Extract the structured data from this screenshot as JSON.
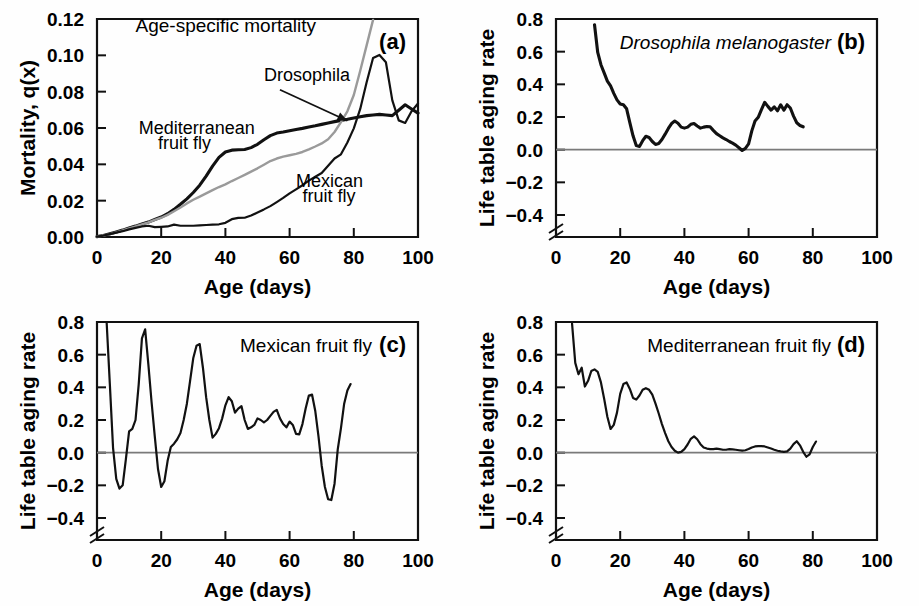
{
  "figure": {
    "caption_letters": [
      "(a)",
      "(b)",
      "(c)",
      "(d)"
    ],
    "shared_xlabel": "Age (days)",
    "colors": {
      "dark": "#111111",
      "grey": "#9a9a9a",
      "zeroline": "#7a7a7a",
      "background": "#ffffff"
    }
  },
  "chart_data": [
    {
      "id": "panel-a",
      "letter": "(a)",
      "type": "line",
      "title": "Age-specific mortality",
      "xlabel": "Age (days)",
      "ylabel": "Mortality, q(x)",
      "xlim": [
        0,
        100
      ],
      "ylim": [
        0,
        0.12
      ],
      "xticks": [
        0,
        20,
        40,
        60,
        80,
        100
      ],
      "xtick_labels": [
        "0",
        "20",
        "40",
        "60",
        "80",
        "100"
      ],
      "yticks": [
        0.0,
        0.02,
        0.04,
        0.06,
        0.08,
        0.1,
        0.12
      ],
      "ytick_labels": [
        "0.00",
        "0.02",
        "0.04",
        "0.06",
        "0.08",
        "0.10",
        "0.12"
      ],
      "grid": false,
      "axis_break": false,
      "legend": "inline-annotations",
      "annotations": [
        {
          "text": "Age-specific mortality",
          "x": 12,
          "y": 0.113,
          "style": "title"
        },
        {
          "text": "Drosophila",
          "x": 52,
          "y": 0.086,
          "style": "series",
          "leader_to": [
            78,
            0.064
          ]
        },
        {
          "text": "Mediterranean",
          "x": 13,
          "y": 0.0565,
          "style": "series"
        },
        {
          "text": "fruit fly",
          "x": 19,
          "y": 0.0485,
          "style": "series"
        },
        {
          "text": "Mexican",
          "x": 62,
          "y": 0.0275,
          "style": "series"
        },
        {
          "text": "fruit fly",
          "x": 64,
          "y": 0.0195,
          "style": "series"
        }
      ],
      "series": [
        {
          "name": "Mediterranean fruit fly",
          "color": "#111111",
          "width": "thick",
          "x": [
            0,
            2,
            4,
            6,
            8,
            10,
            12,
            14,
            16,
            18,
            20,
            22,
            24,
            26,
            28,
            30,
            32,
            34,
            36,
            38,
            40,
            42,
            44,
            46,
            48,
            50,
            52,
            54,
            56,
            58,
            60,
            62,
            64,
            66,
            68,
            70,
            72,
            74,
            76,
            78,
            80,
            82,
            84,
            86,
            88,
            90,
            92,
            94,
            96,
            98,
            100
          ],
          "values": [
            0.0002,
            0.0008,
            0.0018,
            0.0028,
            0.0038,
            0.005,
            0.006,
            0.0072,
            0.0082,
            0.0096,
            0.011,
            0.0128,
            0.0152,
            0.018,
            0.021,
            0.0245,
            0.0285,
            0.0335,
            0.039,
            0.0438,
            0.0468,
            0.0478,
            0.048,
            0.0482,
            0.0492,
            0.051,
            0.0535,
            0.0558,
            0.0572,
            0.0578,
            0.0585,
            0.0592,
            0.0598,
            0.0605,
            0.0612,
            0.062,
            0.0628,
            0.0635,
            0.0642,
            0.0648,
            0.0655,
            0.0662,
            0.0668,
            0.0672,
            0.0675,
            0.0672,
            0.0668,
            0.0698,
            0.0728,
            0.0705,
            0.0682
          ]
        },
        {
          "name": "Drosophila",
          "color": "#9a9a9a",
          "width": "grey",
          "x": [
            0,
            2,
            4,
            6,
            8,
            10,
            12,
            14,
            16,
            18,
            20,
            22,
            24,
            26,
            28,
            30,
            32,
            34,
            36,
            38,
            40,
            42,
            44,
            46,
            48,
            50,
            52,
            54,
            56,
            58,
            60,
            62,
            64,
            66,
            68,
            70,
            72,
            74,
            76,
            78,
            80,
            82,
            84,
            86
          ],
          "values": [
            0.0002,
            0.0008,
            0.0016,
            0.0026,
            0.0036,
            0.0048,
            0.0058,
            0.007,
            0.008,
            0.0094,
            0.0106,
            0.0122,
            0.0142,
            0.0162,
            0.0185,
            0.0205,
            0.0222,
            0.024,
            0.0258,
            0.0275,
            0.029,
            0.0308,
            0.0325,
            0.0342,
            0.036,
            0.0378,
            0.0398,
            0.0418,
            0.0432,
            0.0442,
            0.045,
            0.0458,
            0.0468,
            0.0482,
            0.0498,
            0.0515,
            0.0538,
            0.0578,
            0.0632,
            0.0692,
            0.0782,
            0.0915,
            0.1055,
            0.1195
          ]
        },
        {
          "name": "Mexican fruit fly",
          "color": "#111111",
          "width": "thin",
          "x": [
            0,
            2,
            4,
            6,
            8,
            10,
            12,
            14,
            16,
            18,
            20,
            22,
            24,
            26,
            28,
            30,
            32,
            34,
            36,
            38,
            40,
            42,
            44,
            46,
            48,
            50,
            52,
            54,
            56,
            58,
            60,
            62,
            64,
            66,
            68,
            70,
            72,
            74,
            76,
            78,
            80,
            82,
            84,
            86,
            88,
            90,
            92,
            94,
            96,
            98,
            100
          ],
          "values": [
            0.0002,
            0.0008,
            0.0016,
            0.0024,
            0.0032,
            0.0042,
            0.005,
            0.0058,
            0.0062,
            0.0054,
            0.0056,
            0.0058,
            0.0068,
            0.0062,
            0.0062,
            0.0062,
            0.0064,
            0.0066,
            0.0068,
            0.007,
            0.0078,
            0.0098,
            0.0105,
            0.0106,
            0.0118,
            0.0135,
            0.0152,
            0.017,
            0.0192,
            0.0215,
            0.024,
            0.0262,
            0.0285,
            0.031,
            0.0332,
            0.0352,
            0.0392,
            0.0432,
            0.0455,
            0.052,
            0.0598,
            0.0705,
            0.0852,
            0.0985,
            0.1002,
            0.0962,
            0.0752,
            0.0642,
            0.0628,
            0.0692,
            0.0735
          ]
        }
      ]
    },
    {
      "id": "panel-b",
      "letter": "(b)",
      "type": "line",
      "title": "Drosophila melanogaster",
      "title_italic": true,
      "xlabel": "Age (days)",
      "ylabel": "Life table aging rate",
      "xlim": [
        0,
        100
      ],
      "ylim": [
        -0.4,
        0.8
      ],
      "xticks": [
        0,
        20,
        40,
        60,
        80,
        100
      ],
      "xtick_labels": [
        "0",
        "20",
        "40",
        "60",
        "80",
        "100"
      ],
      "yticks": [
        -0.4,
        -0.2,
        0.0,
        0.2,
        0.4,
        0.6,
        0.8
      ],
      "ytick_labels": [
        "−0.4",
        "−0.2",
        "0.0",
        "0.2",
        "0.4",
        "0.6",
        "0.8"
      ],
      "grid": false,
      "axis_break": true,
      "zeroline": 0.0,
      "series": [
        {
          "name": "Drosophila melanogaster aging rate",
          "color": "#111111",
          "width": "thick",
          "x": [
            12,
            13,
            14,
            15,
            16,
            17,
            18,
            19,
            20,
            21,
            22,
            23,
            24,
            25,
            26,
            27,
            28,
            29,
            30,
            31,
            32,
            33,
            34,
            35,
            36,
            37,
            38,
            39,
            40,
            41,
            42,
            43,
            44,
            45,
            46,
            47,
            48,
            49,
            50,
            51,
            52,
            53,
            54,
            55,
            56,
            57,
            58,
            59,
            60,
            61,
            62,
            63,
            64,
            65,
            66,
            67,
            68,
            69,
            70,
            71,
            72,
            73,
            74,
            75,
            76,
            77
          ],
          "values": [
            0.765,
            0.595,
            0.52,
            0.47,
            0.42,
            0.39,
            0.345,
            0.305,
            0.28,
            0.275,
            0.25,
            0.165,
            0.085,
            0.025,
            0.02,
            0.055,
            0.082,
            0.075,
            0.05,
            0.032,
            0.038,
            0.062,
            0.095,
            0.13,
            0.16,
            0.175,
            0.162,
            0.138,
            0.132,
            0.138,
            0.155,
            0.16,
            0.145,
            0.132,
            0.138,
            0.142,
            0.14,
            0.118,
            0.098,
            0.085,
            0.072,
            0.062,
            0.05,
            0.04,
            0.028,
            0.012,
            -0.005,
            0.008,
            0.035,
            0.115,
            0.175,
            0.198,
            0.245,
            0.29,
            0.265,
            0.242,
            0.262,
            0.238,
            0.275,
            0.242,
            0.275,
            0.255,
            0.205,
            0.165,
            0.148,
            0.14
          ]
        }
      ]
    },
    {
      "id": "panel-c",
      "letter": "(c)",
      "type": "line",
      "title": "Mexican fruit fly",
      "title_italic": false,
      "xlabel": "Age (days)",
      "ylabel": "Life table aging rate",
      "xlim": [
        0,
        100
      ],
      "ylim": [
        -0.4,
        0.8
      ],
      "xticks": [
        0,
        20,
        40,
        60,
        80,
        100
      ],
      "xtick_labels": [
        "0",
        "20",
        "40",
        "60",
        "80",
        "100"
      ],
      "yticks": [
        -0.4,
        -0.2,
        0.0,
        0.2,
        0.4,
        0.6,
        0.8
      ],
      "ytick_labels": [
        "−0.4",
        "−0.2",
        "0.0",
        "0.2",
        "0.4",
        "0.6",
        "0.8"
      ],
      "grid": false,
      "axis_break": true,
      "zeroline": 0.0,
      "series": [
        {
          "name": "Mexican fruit fly aging rate",
          "color": "#111111",
          "width": "thin",
          "x": [
            3,
            4,
            5,
            6,
            7,
            8,
            9,
            10,
            11,
            12,
            13,
            14,
            15,
            16,
            17,
            18,
            19,
            20,
            21,
            22,
            23,
            24,
            25,
            26,
            27,
            28,
            29,
            30,
            31,
            32,
            33,
            34,
            35,
            36,
            37,
            38,
            39,
            40,
            41,
            42,
            43,
            44,
            45,
            46,
            47,
            48,
            49,
            50,
            51,
            52,
            53,
            54,
            55,
            56,
            57,
            58,
            59,
            60,
            61,
            62,
            63,
            64,
            65,
            66,
            67,
            68,
            69,
            70,
            71,
            72,
            73,
            74,
            75,
            76,
            77,
            78,
            79
          ],
          "values": [
            0.8,
            0.42,
            0.03,
            -0.16,
            -0.22,
            -0.2,
            -0.04,
            0.13,
            0.145,
            0.2,
            0.42,
            0.7,
            0.755,
            0.54,
            0.31,
            0.1,
            -0.1,
            -0.21,
            -0.175,
            -0.05,
            0.035,
            0.055,
            0.082,
            0.12,
            0.2,
            0.3,
            0.44,
            0.58,
            0.655,
            0.665,
            0.52,
            0.34,
            0.2,
            0.092,
            0.115,
            0.15,
            0.21,
            0.29,
            0.34,
            0.315,
            0.245,
            0.27,
            0.285,
            0.2,
            0.145,
            0.155,
            0.17,
            0.21,
            0.2,
            0.185,
            0.2,
            0.225,
            0.25,
            0.262,
            0.21,
            0.175,
            0.155,
            0.19,
            0.17,
            0.115,
            0.112,
            0.175,
            0.27,
            0.35,
            0.355,
            0.255,
            0.1,
            -0.08,
            -0.21,
            -0.285,
            -0.29,
            -0.19,
            0.02,
            0.15,
            0.3,
            0.38,
            0.42
          ]
        }
      ]
    },
    {
      "id": "panel-d",
      "letter": "(d)",
      "type": "line",
      "title": "Mediterranean fruit fly",
      "title_italic": false,
      "xlabel": "Age (days)",
      "ylabel": "Life table aging rate",
      "xlim": [
        0,
        100
      ],
      "ylim": [
        -0.4,
        0.8
      ],
      "xticks": [
        0,
        20,
        40,
        60,
        80,
        100
      ],
      "xtick_labels": [
        "0",
        "20",
        "40",
        "60",
        "80",
        "100"
      ],
      "yticks": [
        -0.4,
        -0.2,
        0.0,
        0.2,
        0.4,
        0.6,
        0.8
      ],
      "ytick_labels": [
        "−0.4",
        "−0.2",
        "0.0",
        "0.2",
        "0.4",
        "0.6",
        "0.8"
      ],
      "grid": false,
      "axis_break": true,
      "zeroline": 0.0,
      "series": [
        {
          "name": "Mediterranean fruit fly aging rate",
          "color": "#111111",
          "width": "thin",
          "x": [
            5,
            6,
            7,
            8,
            9,
            10,
            11,
            12,
            13,
            14,
            15,
            16,
            17,
            18,
            19,
            20,
            21,
            22,
            23,
            24,
            25,
            26,
            27,
            28,
            29,
            30,
            31,
            32,
            33,
            34,
            35,
            36,
            37,
            38,
            39,
            40,
            41,
            42,
            43,
            44,
            45,
            46,
            47,
            48,
            49,
            50,
            51,
            52,
            53,
            54,
            55,
            56,
            57,
            58,
            59,
            60,
            61,
            62,
            63,
            64,
            65,
            66,
            67,
            68,
            69,
            70,
            71,
            72,
            73,
            74,
            75,
            76,
            77,
            78,
            79,
            80,
            81
          ],
          "values": [
            0.79,
            0.55,
            0.48,
            0.52,
            0.405,
            0.44,
            0.5,
            0.51,
            0.495,
            0.43,
            0.33,
            0.22,
            0.145,
            0.17,
            0.245,
            0.36,
            0.42,
            0.43,
            0.39,
            0.335,
            0.325,
            0.35,
            0.385,
            0.395,
            0.385,
            0.355,
            0.3,
            0.24,
            0.175,
            0.12,
            0.07,
            0.035,
            0.012,
            0.0,
            0.005,
            0.022,
            0.05,
            0.085,
            0.1,
            0.082,
            0.052,
            0.032,
            0.025,
            0.022,
            0.022,
            0.025,
            0.022,
            0.018,
            0.018,
            0.022,
            0.02,
            0.018,
            0.015,
            0.012,
            0.015,
            0.022,
            0.032,
            0.038,
            0.04,
            0.04,
            0.038,
            0.032,
            0.025,
            0.018,
            0.012,
            0.008,
            0.005,
            0.008,
            0.025,
            0.052,
            0.07,
            0.045,
            0.005,
            -0.025,
            -0.01,
            0.035,
            0.068
          ]
        }
      ]
    }
  ]
}
